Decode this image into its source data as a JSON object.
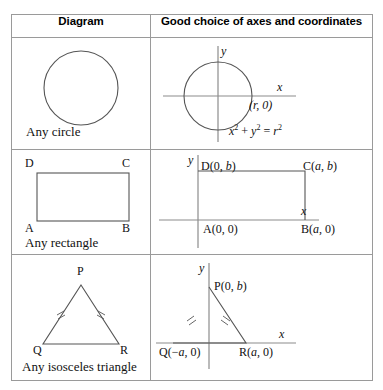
{
  "table": {
    "headers": {
      "col1": "Diagram",
      "col2": "Good choice of axes and coordinates"
    },
    "rows": [
      {
        "id": "circle",
        "caption": "Any circle",
        "coord_labels": {
          "y_axis": "y",
          "x_axis": "x",
          "point": "(r, 0)",
          "equation_x2": "x",
          "equation_plus": "+",
          "equation_y2": "y",
          "equation_eq": "=",
          "equation_r2": "r",
          "exp2": "2"
        }
      },
      {
        "id": "rectangle",
        "caption": "Any rectangle",
        "vertex_labels": {
          "a": "A",
          "b": "B",
          "c": "C",
          "d": "D"
        },
        "coord_labels": {
          "y_axis": "y",
          "x_axis": "x",
          "d": "D(0, b)",
          "c": "C(a, b)",
          "a": "A(0, 0)",
          "b": "B(a, 0)"
        }
      },
      {
        "id": "isosceles-triangle",
        "caption": "Any isosceles triangle",
        "vertex_labels": {
          "p": "P",
          "q": "Q",
          "r": "R"
        },
        "coord_labels": {
          "y_axis": "y",
          "x_axis": "x",
          "p": "P(0, b)",
          "q": "Q(−a, 0)",
          "r": "R(a, 0)"
        }
      }
    ]
  },
  "colors": {
    "border": "#9a9a9a",
    "stroke": "#4a4a4a",
    "axis": "#8c8c8c",
    "text": "#111111",
    "background": "#ffffff"
  }
}
